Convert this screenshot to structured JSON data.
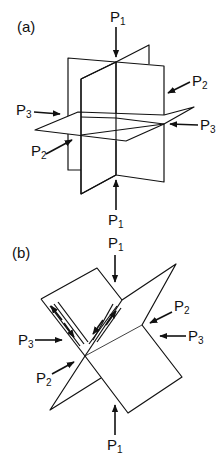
{
  "panels": [
    {
      "id": "a",
      "label": "(a)",
      "description": "Three mutually orthogonal planes with principal stresses",
      "stress_labels": {
        "p1_top": {
          "main": "P",
          "sub": "1"
        },
        "p1_bottom": {
          "main": "P",
          "sub": "1"
        },
        "p2_right": {
          "main": "P",
          "sub": "2"
        },
        "p2_left": {
          "main": "P",
          "sub": "2"
        },
        "p3_left": {
          "main": "P",
          "sub": "3"
        },
        "p3_right": {
          "main": "P",
          "sub": "3"
        }
      }
    },
    {
      "id": "b",
      "label": "(b)",
      "description": "Conjugate shear planes with slip arrows",
      "stress_labels": {
        "p1_top": {
          "main": "P",
          "sub": "1"
        },
        "p1_bottom": {
          "main": "P",
          "sub": "1"
        },
        "p2_right": {
          "main": "P",
          "sub": "2"
        },
        "p2_left": {
          "main": "P",
          "sub": "2"
        },
        "p3_left": {
          "main": "P",
          "sub": "3"
        },
        "p3_right": {
          "main": "P",
          "sub": "3"
        }
      }
    }
  ],
  "colors": {
    "line": "#111111",
    "background": "#ffffff"
  }
}
